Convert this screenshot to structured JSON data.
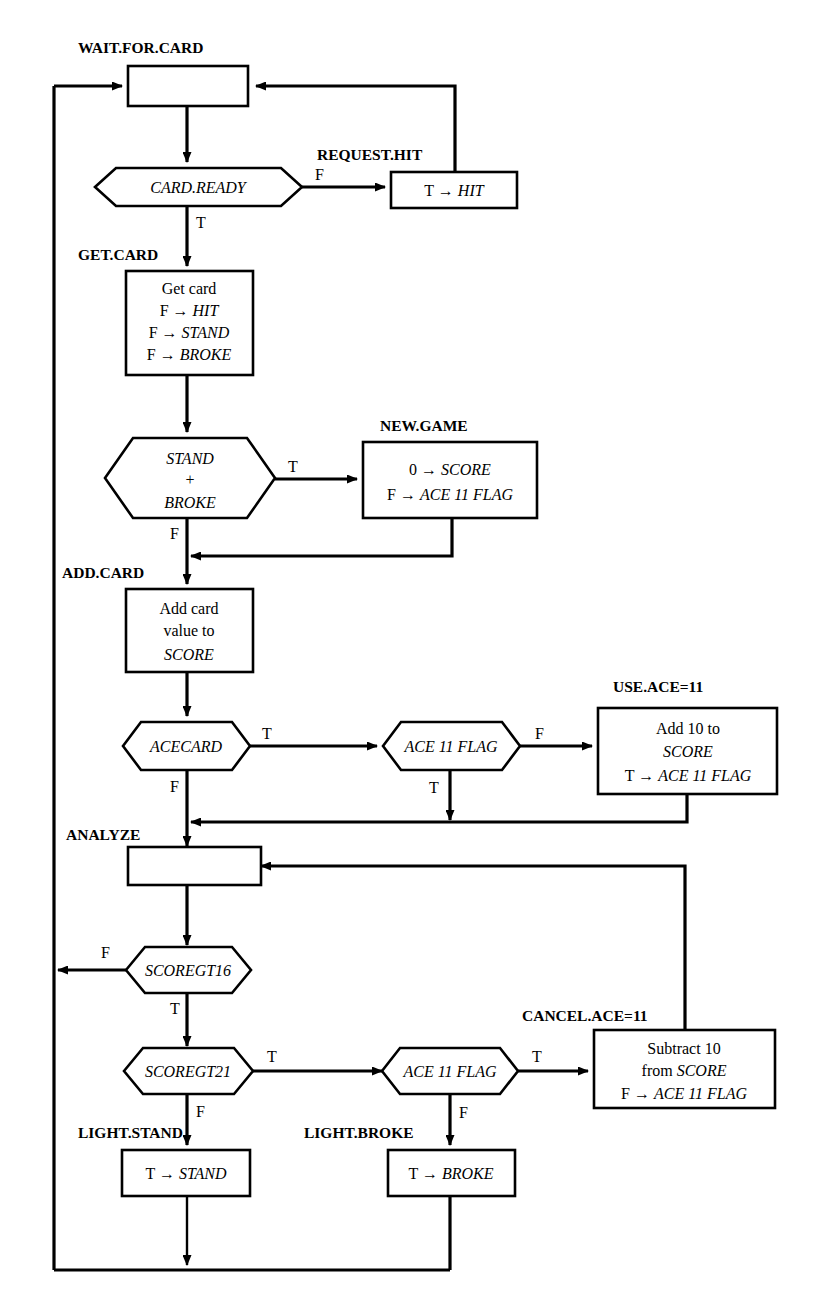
{
  "diagram": {
    "background": "#ffffff",
    "stroke": "#000000"
  },
  "labels": {
    "wait_for_card": "WAIT.FOR.CARD",
    "request_hit": "REQUEST.HIT",
    "get_card": "GET.CARD",
    "new_game": "NEW.GAME",
    "add_card": "ADD.CARD",
    "use_ace": "USE.ACE=11",
    "analyze": "ANALYZE",
    "cancel_ace": "CANCEL.ACE=11",
    "light_stand": "LIGHT.STAND",
    "light_broke": "LIGHT.BROKE"
  },
  "nodes": {
    "wait_box": {
      "lines": []
    },
    "card_ready": {
      "text": "CARD.READY"
    },
    "request_hit_box": {
      "lines": [
        "T → HIT"
      ]
    },
    "get_card_box": {
      "lines": [
        "Get card",
        "F → HIT",
        "F → STAND",
        "F → BROKE"
      ]
    },
    "stand_broke": {
      "lines": [
        "STAND",
        "+",
        "BROKE"
      ]
    },
    "new_game_box": {
      "lines": [
        "0 → SCORE",
        "F → ACE 11 FLAG"
      ]
    },
    "add_card_box": {
      "lines": [
        "Add card",
        "value to",
        "SCORE"
      ]
    },
    "acecard": {
      "text": "ACECARD"
    },
    "ace11flag_top": {
      "text": "ACE 11 FLAG"
    },
    "use_ace_box": {
      "lines": [
        "Add 10 to",
        "SCORE",
        "T → ACE 11 FLAG"
      ]
    },
    "analyze_box": {
      "lines": []
    },
    "scoregt16": {
      "text": "SCOREGT16"
    },
    "scoregt21": {
      "text": "SCOREGT21"
    },
    "ace11flag_bottom": {
      "text": "ACE 11 FLAG"
    },
    "cancel_ace_box": {
      "lines": [
        "Subtract 10",
        "from SCORE",
        "F → ACE 11 FLAG"
      ]
    },
    "light_stand_box": {
      "lines": [
        "T → STAND"
      ]
    },
    "light_broke_box": {
      "lines": [
        "T → BROKE"
      ]
    }
  },
  "edge_labels": {
    "card_ready_false": "F",
    "card_ready_true": "T",
    "stand_broke_true": "T",
    "stand_broke_false": "F",
    "acecard_true": "T",
    "acecard_false": "F",
    "ace11flag_top_false": "F",
    "ace11flag_top_true": "T",
    "scoregt16_false": "F",
    "scoregt16_true": "T",
    "scoregt21_true": "T",
    "scoregt21_false": "F",
    "ace11flag_bottom_true": "T",
    "ace11flag_bottom_false": "F"
  }
}
